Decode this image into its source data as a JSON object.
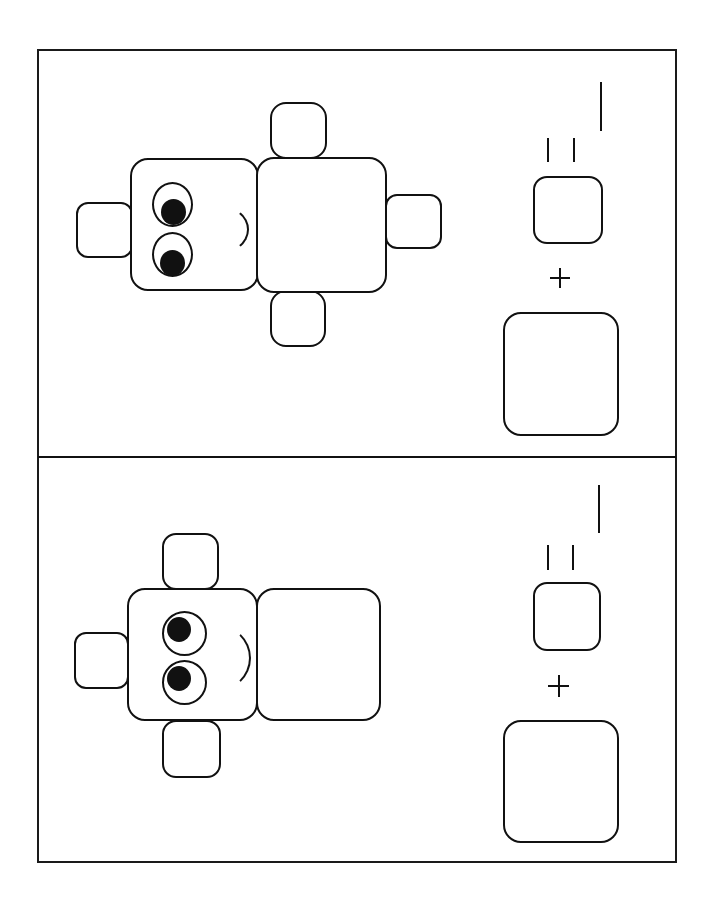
{
  "worksheet": {
    "orientation": "rotated-90",
    "panels": [
      {
        "id": "panel-1",
        "figure": {
          "description": "robot figure: head with two eyes and smile, body, left ear, top arm, bottom arm, right leg",
          "parts": [
            "head",
            "body",
            "ear",
            "arm-top",
            "arm-bottom",
            "leg-right"
          ],
          "part_count": 6
        },
        "equation": {
          "operator": "+",
          "equals": "=",
          "answer_blank": "",
          "terms": [
            "big-square",
            "small-square"
          ]
        }
      },
      {
        "id": "panel-2",
        "figure": {
          "description": "robot figure: head with two eyes and smile, body, left ear, top arm, bottom arm",
          "parts": [
            "head",
            "body",
            "ear",
            "arm-top",
            "arm-bottom"
          ],
          "part_count": 5
        },
        "equation": {
          "operator": "+",
          "equals": "=",
          "answer_blank": "",
          "terms": [
            "big-square",
            "small-square"
          ]
        }
      }
    ]
  },
  "colors": {
    "ink": "#111111",
    "paper": "#ffffff"
  }
}
